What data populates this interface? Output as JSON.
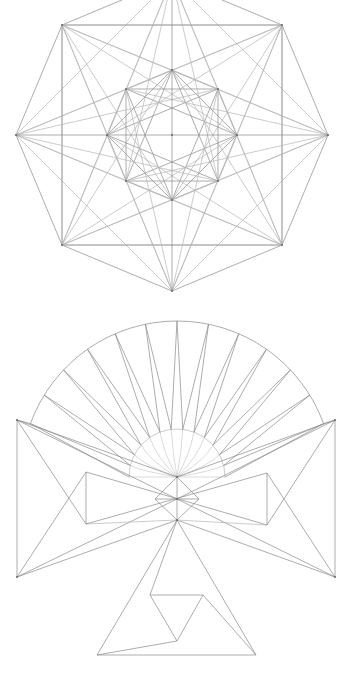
{
  "colors": {
    "background": "#ffffff",
    "line": "#8a8a8a",
    "line_light": "#b4b4b4",
    "vertex": "#6e6e6e"
  },
  "octagon_figure": {
    "center": [
      172,
      135
    ],
    "outer_radius": 156,
    "inner_radius": 65,
    "outer_vertices": [
      [
        172,
        -21
      ],
      [
        282,
        25
      ],
      [
        328,
        135
      ],
      [
        282,
        245
      ],
      [
        172,
        291
      ],
      [
        62,
        245
      ],
      [
        16,
        135
      ],
      [
        62,
        25
      ]
    ],
    "inner_vertices": [
      [
        172,
        70
      ],
      [
        218,
        89
      ],
      [
        237,
        135
      ],
      [
        218,
        181
      ],
      [
        172,
        200
      ],
      [
        126,
        181
      ],
      [
        107,
        135
      ],
      [
        126,
        89
      ]
    ],
    "outer_steps": [
      1,
      2,
      3
    ],
    "inner_steps": [
      2,
      3
    ],
    "outer_to_inner_offsets": [
      2,
      3,
      -2,
      -3
    ],
    "axes": true
  },
  "fan_figure": {
    "hub": [
      177,
      477
    ],
    "outer_arc": {
      "center": [
        177,
        477
      ],
      "radius": 156,
      "start_deg": 160,
      "end_deg": 20
    },
    "inner_arc": {
      "center": [
        177,
        477
      ],
      "radius": 48,
      "start_deg": 180,
      "end_deg": 0
    },
    "spoke_count": 13,
    "wings": {
      "left": {
        "top": [
          17,
          420
        ],
        "bottom": [
          17,
          577
        ],
        "tri_top": [
          86,
          472
        ],
        "tri_bottom": [
          86,
          524
        ]
      },
      "right": {
        "top": [
          335,
          420
        ],
        "bottom": [
          335,
          577
        ],
        "tri_top": [
          267,
          473
        ],
        "tri_bottom": [
          267,
          525
        ]
      }
    },
    "center_column": {
      "a": [
        177,
        477
      ],
      "b": [
        177,
        499
      ],
      "c": [
        177,
        520
      ],
      "diamond_left": [
        155,
        499
      ],
      "diamond_right": [
        199,
        499
      ]
    },
    "bottom_triangle": {
      "apex": [
        177,
        520
      ],
      "left": [
        97,
        655
      ],
      "right": [
        256,
        655
      ]
    },
    "spiral": {
      "p1": [
        150,
        595
      ],
      "p2": [
        203,
        595
      ],
      "p3": [
        177,
        641
      ]
    }
  }
}
